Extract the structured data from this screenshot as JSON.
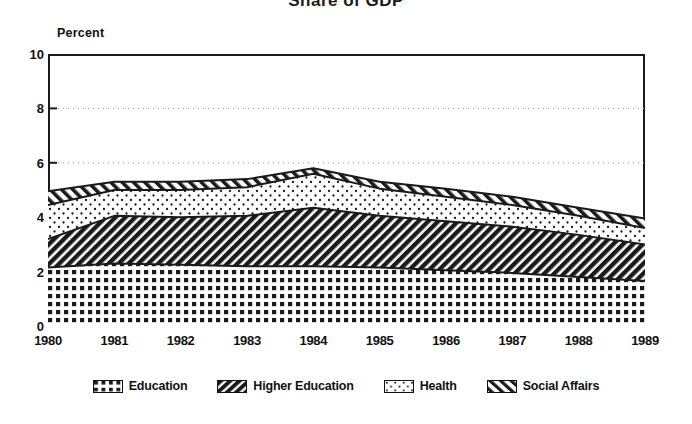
{
  "chart_data": {
    "type": "area",
    "title": "Share of GDP",
    "subtitle": "",
    "xlabel": "",
    "ylabel": "Percent",
    "stacked": true,
    "grid": true,
    "legend_position": "bottom",
    "xlim": [
      1980,
      1989
    ],
    "ylim": [
      0,
      10
    ],
    "yticks": [
      0,
      2,
      4,
      6,
      8,
      10
    ],
    "categories": [
      1980,
      1981,
      1982,
      1983,
      1984,
      1985,
      1986,
      1987,
      1988,
      1989
    ],
    "xtick_labels": [
      "1980",
      "1981",
      "1982",
      "1983",
      "1984",
      "1985",
      "1986",
      "1987",
      "1988",
      "1989"
    ],
    "series": [
      {
        "name": "Education",
        "pattern": "dense-dot-grid",
        "values": [
          2.15,
          2.3,
          2.25,
          2.2,
          2.2,
          2.15,
          2.05,
          1.95,
          1.8,
          1.65
        ]
      },
      {
        "name": "Higher Education",
        "pattern": "forward-hatch",
        "values": [
          1.05,
          1.75,
          1.75,
          1.85,
          2.15,
          1.9,
          1.8,
          1.7,
          1.55,
          1.35
        ]
      },
      {
        "name": "Health",
        "pattern": "sparse-dot",
        "values": [
          1.25,
          0.95,
          1.0,
          1.05,
          1.25,
          1.0,
          0.9,
          0.8,
          0.7,
          0.6
        ]
      },
      {
        "name": "Social Affairs",
        "pattern": "backward-hatch",
        "values": [
          0.5,
          0.3,
          0.3,
          0.3,
          0.2,
          0.25,
          0.3,
          0.3,
          0.3,
          0.35
        ]
      }
    ],
    "cumulative_tops": {
      "education": [
        2.15,
        2.3,
        2.25,
        2.2,
        2.2,
        2.15,
        2.05,
        1.95,
        1.8,
        1.65
      ],
      "higher_education": [
        3.2,
        4.05,
        4.0,
        4.05,
        4.35,
        4.05,
        3.85,
        3.65,
        3.35,
        3.0
      ],
      "health": [
        4.45,
        5.0,
        5.0,
        5.1,
        5.6,
        5.05,
        4.75,
        4.45,
        4.05,
        3.6
      ],
      "social_affairs": [
        4.95,
        5.3,
        5.3,
        5.4,
        5.8,
        5.3,
        5.05,
        4.75,
        4.35,
        3.95
      ]
    }
  },
  "legend": {
    "items": [
      {
        "label": "Education"
      },
      {
        "label": "Higher Education"
      },
      {
        "label": "Health"
      },
      {
        "label": "Social Affairs"
      }
    ]
  },
  "colors": {
    "ink": "#1a1a1a",
    "background": "#ffffff",
    "grid": "#9a9a9a"
  }
}
